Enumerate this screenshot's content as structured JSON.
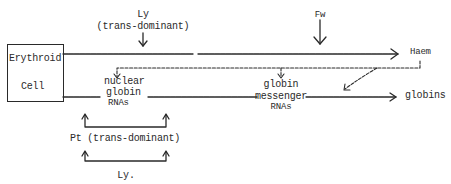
{
  "diagram": {
    "type": "regulatory pathway",
    "source_node": {
      "line1": "Erythroid",
      "line2": "Cell"
    },
    "top_regulator": {
      "name": "Ly",
      "qualifier": "(trans-dominant)"
    },
    "fw_regulator": {
      "name": "Fw"
    },
    "haem_label": "Haem",
    "nuclear_rnas": {
      "line1": "nuclear",
      "line2": "globin",
      "line3": "RNAs"
    },
    "messenger_rnas": {
      "line1": "globin",
      "line2": "messenger",
      "line3": "RNAs"
    },
    "globins_label": "globins",
    "bottom_regulator": {
      "label": "Pt (trans-dominant)"
    },
    "bottom_ly": {
      "label": "Ly."
    },
    "colors": {
      "ink": "#2a2a2a",
      "background": "#ffffff"
    }
  }
}
